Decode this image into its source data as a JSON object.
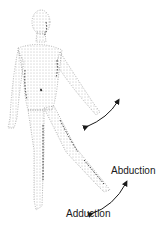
{
  "diagram": {
    "labels": {
      "abduction": "Abduction",
      "adduction": "Adduction"
    },
    "colors": {
      "figure_stipple": "#555555",
      "figure_shadow": "#222222",
      "arrow": "#1a1a1a",
      "text": "#1a1a1a",
      "background": "#ffffff"
    }
  }
}
